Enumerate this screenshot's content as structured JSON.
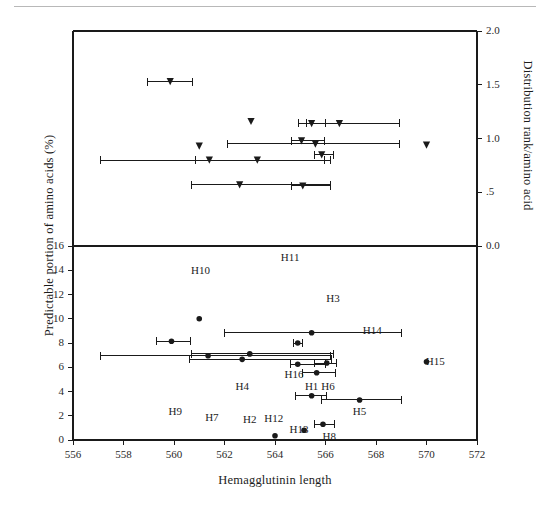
{
  "figure": {
    "name": "hemagglutinin-scatter-figure",
    "background": "#ffffff",
    "ink": "#1a1a1a"
  },
  "chart_data": {
    "type": "scatter",
    "title": "",
    "xlabel": "Hemagglutinin length",
    "ylabel": "Predictable portion of amino acids (%)",
    "ylabel_right": "Distribution rank/amino acid",
    "xlim": [
      556,
      572
    ],
    "xticks": [
      556,
      558,
      560,
      562,
      564,
      566,
      568,
      570,
      572
    ],
    "xticklabels": [
      "556",
      "558",
      "560",
      "562",
      "564",
      "566",
      "568",
      "570",
      "572"
    ],
    "grid": false,
    "legend": null,
    "panels": [
      {
        "name": "upper-panel",
        "id": "upper",
        "ylim": [
          0.0,
          2.0
        ],
        "yticks": [
          0.0,
          0.5,
          1.0,
          1.5,
          2.0
        ],
        "yticklabels": [
          "0.0",
          ".5",
          "1.0",
          "1.5",
          "2.0"
        ],
        "axis_side": "right",
        "marker": "triangle-down",
        "ylabel": "Distribution rank/amino acid",
        "points": [
          {
            "label": "H9",
            "x": 559.85,
            "y": 1.53,
            "xerr_low": 558.95,
            "xerr_high": 560.75
          },
          {
            "label": "H10",
            "x": 563.05,
            "y": 1.16,
            "xerr_low": 563.05,
            "xerr_high": 563.05
          },
          {
            "label": "H1",
            "x": 565.45,
            "y": 1.14,
            "xerr_low": 564.95,
            "xerr_high": 566.0
          },
          {
            "label": "H3",
            "x": 566.55,
            "y": 1.14,
            "xerr_low": 565.25,
            "xerr_high": 568.95
          },
          {
            "label": "H7",
            "x": 561.0,
            "y": 0.93,
            "xerr_low": 561.0,
            "xerr_high": 561.0
          },
          {
            "label": "H16",
            "x": 565.05,
            "y": 0.98,
            "xerr_low": 564.65,
            "xerr_high": 565.95
          },
          {
            "label": "H6",
            "x": 565.6,
            "y": 0.95,
            "xerr_low": 562.1,
            "xerr_high": 568.95
          },
          {
            "label": "H15",
            "x": 570.0,
            "y": 0.94,
            "xerr_low": 570.0,
            "xerr_high": 570.0
          },
          {
            "label": "H4",
            "x": 561.4,
            "y": 0.8,
            "xerr_low": 557.1,
            "xerr_high": 565.95
          },
          {
            "label": "H11",
            "x": 563.3,
            "y": 0.8,
            "xerr_low": 560.85,
            "xerr_high": 566.2
          },
          {
            "label": "H14",
            "x": 565.85,
            "y": 0.85,
            "xerr_low": 565.55,
            "xerr_high": 566.3
          },
          {
            "label": "H2",
            "x": 562.6,
            "y": 0.57,
            "xerr_low": 560.7,
            "xerr_high": 566.2
          },
          {
            "label": "H5",
            "x": 565.1,
            "y": 0.56,
            "xerr_low": 564.65,
            "xerr_high": 566.2
          }
        ]
      },
      {
        "name": "lower-panel",
        "id": "lower",
        "ylim": [
          0,
          16
        ],
        "yticks": [
          0,
          2,
          4,
          6,
          8,
          10,
          12,
          14,
          16
        ],
        "yticklabels": [
          "0",
          "2",
          "4",
          "6",
          "8",
          "10",
          "12",
          "14",
          "16"
        ],
        "axis_side": "left",
        "marker": "circle",
        "ylabel": "Predictable portion of amino acids (%)",
        "points": [
          {
            "label": "H10",
            "x": 561.0,
            "y": 10.0,
            "xerr_low": 561.0,
            "xerr_high": 561.0,
            "label_x": 561.05,
            "label_y": 13.9
          },
          {
            "label": "H3",
            "x": 565.45,
            "y": 8.85,
            "xerr_low": 562.0,
            "xerr_high": 569.0,
            "label_x": 566.3,
            "label_y": 11.6
          },
          {
            "label": "H9",
            "x": 559.9,
            "y": 8.15,
            "xerr_low": 559.3,
            "xerr_high": 560.65,
            "label_x": 560.05,
            "label_y": 2.35
          },
          {
            "label": "H14",
            "x": 564.9,
            "y": 8.0,
            "xerr_low": 564.75,
            "xerr_high": 565.1,
            "label_x": 567.85,
            "label_y": 8.95
          },
          {
            "label": "H7",
            "x": 561.35,
            "y": 6.95,
            "xerr_low": 557.1,
            "xerr_high": 566.2,
            "label_x": 561.5,
            "label_y": 1.85
          },
          {
            "label": "H4",
            "x": 563.0,
            "y": 7.1,
            "xerr_low": 560.7,
            "xerr_high": 566.3,
            "label_x": 562.7,
            "label_y": 4.35
          },
          {
            "label": "H2",
            "x": 562.7,
            "y": 6.65,
            "xerr_low": 560.6,
            "xerr_high": 566.25,
            "label_x": 563.0,
            "label_y": 1.65
          },
          {
            "label": "H16",
            "x": 564.9,
            "y": 6.25,
            "xerr_low": 564.6,
            "xerr_high": 566.0,
            "label_x": 564.75,
            "label_y": 5.35
          },
          {
            "label": "H6",
            "x": 566.05,
            "y": 6.35,
            "xerr_low": 565.55,
            "xerr_high": 566.45,
            "label_x": 566.1,
            "label_y": 4.35
          },
          {
            "label": "H15",
            "x": 570.0,
            "y": 6.45,
            "xerr_low": 570.0,
            "xerr_high": 570.0,
            "label_x": 570.35,
            "label_y": 6.45
          },
          {
            "label": "H1",
            "x": 565.65,
            "y": 5.55,
            "xerr_low": 565.1,
            "xerr_high": 566.4,
            "label_x": 565.45,
            "label_y": 4.35
          },
          {
            "label": "H11",
            "x": 565.45,
            "y": 3.65,
            "xerr_low": 564.8,
            "xerr_high": 566.05,
            "label_x": 564.6,
            "label_y": 15.0
          },
          {
            "label": "H5",
            "x": 567.35,
            "y": 3.3,
            "xerr_low": 565.85,
            "xerr_high": 569.0,
            "label_x": 567.35,
            "label_y": 2.35
          },
          {
            "label": "H8",
            "x": 565.9,
            "y": 1.3,
            "xerr_low": 565.55,
            "xerr_high": 566.35,
            "label_x": 566.15,
            "label_y": 0.25
          },
          {
            "label": "H12",
            "x": 564.0,
            "y": 0.35,
            "xerr_low": 564.0,
            "xerr_high": 564.0,
            "label_x": 563.95,
            "label_y": 1.75
          },
          {
            "label": "H13",
            "x": 565.15,
            "y": 0.8,
            "xerr_low": 565.15,
            "xerr_high": 565.15,
            "label_x": 564.95,
            "label_y": 0.85
          }
        ]
      }
    ]
  }
}
